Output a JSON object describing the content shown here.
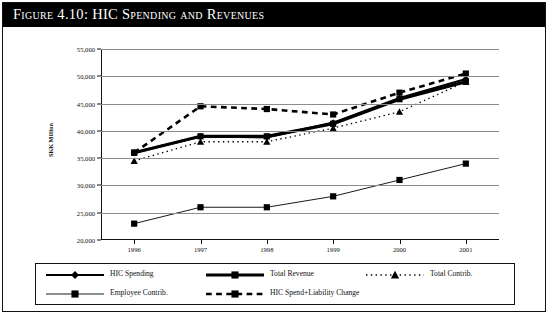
{
  "figure": {
    "title": "Figure 4.10:  HIC Spending and Revenues"
  },
  "axes": {
    "ylabel": "SKK Million",
    "yticks": [
      "20,000",
      "25,000",
      "30,000",
      "35,000",
      "40,000",
      "45,000",
      "50,000",
      "55,000"
    ],
    "xticks": [
      "1996",
      "1997",
      "1998",
      "1999",
      "2000",
      "2001"
    ]
  },
  "legend": [
    {
      "label": "HIC Spending",
      "marker": "diamond",
      "dash": "solid",
      "width": 2.2
    },
    {
      "label": "Total Revenue",
      "marker": "square",
      "dash": "solid",
      "width": 3.2
    },
    {
      "label": "Total Contrib.",
      "marker": "triangle",
      "dash": "dotted",
      "width": 1.3
    },
    {
      "label": "Employee Contrib.",
      "marker": "square",
      "dash": "solid",
      "width": 0.9
    },
    {
      "label": "HIC Spend+Liability Change",
      "marker": "square",
      "dash": "dashed",
      "width": 2.6
    }
  ],
  "chart_data": {
    "type": "line",
    "title": "HIC Spending and Revenues",
    "xlabel": "",
    "ylabel": "SKK Million",
    "categories": [
      "1996",
      "1997",
      "1998",
      "1999",
      "2000",
      "2001"
    ],
    "ylim": [
      20000,
      55000
    ],
    "ytick_step": 5000,
    "grid": true,
    "legend_position": "bottom",
    "series": [
      {
        "name": "HIC Spending",
        "marker": "diamond",
        "dash": "solid",
        "values": [
          36000,
          39000,
          38800,
          41500,
          46000,
          49500
        ]
      },
      {
        "name": "Total Revenue",
        "marker": "square",
        "dash": "solid",
        "values": [
          36000,
          39000,
          39000,
          41300,
          45800,
          49000
        ]
      },
      {
        "name": "Total Contrib.",
        "marker": "triangle",
        "dash": "dotted",
        "values": [
          34500,
          38000,
          38000,
          40500,
          43500,
          49000
        ]
      },
      {
        "name": "Employee Contrib.",
        "marker": "square",
        "dash": "solid",
        "values": [
          23000,
          26000,
          26000,
          28000,
          31000,
          34000
        ]
      },
      {
        "name": "HIC Spend+Liability Change",
        "marker": "square",
        "dash": "dashed",
        "values": [
          36000,
          44500,
          44000,
          43000,
          47000,
          50500
        ]
      }
    ]
  }
}
